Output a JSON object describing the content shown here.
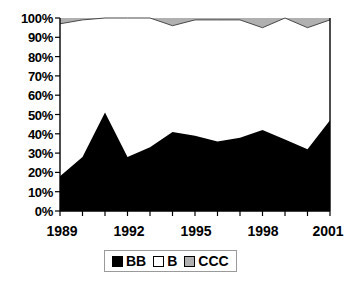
{
  "chart_data": {
    "type": "area",
    "stacked": true,
    "normalized_percent": true,
    "title": "",
    "subtitle": "",
    "xlabel": "",
    "ylabel": "",
    "x": [
      1989,
      1990,
      1991,
      1992,
      1993,
      1994,
      1995,
      1996,
      1997,
      1998,
      1999,
      2000,
      2001
    ],
    "xlim": [
      1989,
      2001
    ],
    "ylim": [
      0,
      100
    ],
    "grid": false,
    "legend_position": "bottom-center",
    "axis_tick_labels": {
      "x": [
        "1989",
        "1992",
        "1995",
        "1998",
        "2001"
      ],
      "x_tick_values": [
        1989,
        1992,
        1995,
        1998,
        2001
      ],
      "x_minor_tick_values": [
        1989,
        1990,
        1991,
        1992,
        1993,
        1994,
        1995,
        1996,
        1997,
        1998,
        1999,
        2000,
        2001
      ],
      "y": [
        "0%",
        "10%",
        "20%",
        "30%",
        "40%",
        "50%",
        "60%",
        "70%",
        "80%",
        "90%",
        "100%"
      ],
      "y_tick_values": [
        0,
        10,
        20,
        30,
        40,
        50,
        60,
        70,
        80,
        90,
        100
      ]
    },
    "series": [
      {
        "name": "BB",
        "color": "#000000",
        "values": [
          18,
          28,
          51,
          28,
          33,
          41,
          39,
          36,
          38,
          42,
          37,
          32,
          47
        ]
      },
      {
        "name": "B",
        "color": "#ffffff",
        "values": [
          79,
          71,
          49,
          72,
          67,
          55,
          60,
          63,
          61,
          53,
          63,
          63,
          52
        ]
      },
      {
        "name": "CCC",
        "color": "#b0b0b0",
        "values": [
          3,
          1,
          0,
          0,
          0,
          4,
          1,
          1,
          1,
          5,
          0,
          5,
          1
        ]
      }
    ],
    "cumulative_top_of_B": [
      97,
      99,
      100,
      100,
      100,
      96,
      99,
      99,
      99,
      95,
      100,
      95,
      99
    ]
  },
  "legend": {
    "items": [
      {
        "label": "BB",
        "swatch_color": "#000000",
        "swatch_name": "legend-swatch-bb"
      },
      {
        "label": "B",
        "swatch_color": "#ffffff",
        "swatch_name": "legend-swatch-b"
      },
      {
        "label": "CCC",
        "swatch_color": "#b0b0b0",
        "swatch_name": "legend-swatch-ccc"
      }
    ]
  },
  "axis": {
    "y_labels": [
      "100%",
      "90%",
      "80%",
      "70%",
      "60%",
      "50%",
      "40%",
      "30%",
      "20%",
      "10%",
      "0%"
    ],
    "x_labels": [
      "1989",
      "1992",
      "1995",
      "1998",
      "2001"
    ]
  },
  "colors": {
    "bb": "#000000",
    "b": "#ffffff",
    "ccc": "#b0b0b0",
    "axis": "#000000",
    "background": "#ffffff"
  }
}
